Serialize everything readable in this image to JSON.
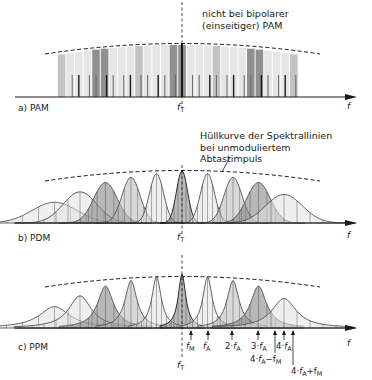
{
  "figure": {
    "panels": [
      {
        "id": "a",
        "label": "a) PAM",
        "annotation_lines": [
          "nicht bei bipolarer",
          "(einseitiger) PAM"
        ],
        "center_label": "f",
        "center_sub": "T",
        "axis_label": "f"
      },
      {
        "id": "b",
        "label": "b) PDM",
        "annotation_lines": [
          "Hüllkurve der Spektrallinien",
          "bei unmoduliertem",
          "Abtastimpuls"
        ],
        "center_label": "f",
        "center_sub": "T",
        "axis_label": "f"
      },
      {
        "id": "c",
        "label": "c) PPM",
        "center_label": "f",
        "center_sub": "T",
        "axis_label": "f",
        "markers": [
          {
            "pre": "",
            "f": "f",
            "sub": "M",
            "post": ""
          },
          {
            "pre": "",
            "f": "f",
            "sub": "A",
            "post": ""
          },
          {
            "pre": "2·",
            "f": "f",
            "sub": "A",
            "post": ""
          },
          {
            "pre": "3·",
            "f": "f",
            "sub": "A",
            "post": ""
          },
          {
            "pre": "4·",
            "f": "f",
            "sub": "A",
            "post": ""
          },
          {
            "pre": "4·",
            "f": "f",
            "sub": "A",
            "post": "−f",
            "post_sub": "M"
          },
          {
            "pre": "4·",
            "f": "f",
            "sub": "A",
            "post": "+f",
            "post_sub": "M"
          }
        ]
      }
    ],
    "colors": {
      "ink": "#1a1a1a",
      "light_fill": "#e2e2e2",
      "mid_fill": "#b8b8b8",
      "dark_fill": "#7d7d7d"
    }
  }
}
